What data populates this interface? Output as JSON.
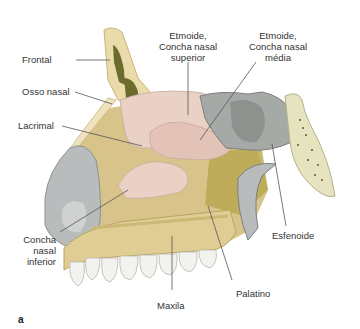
{
  "figure": {
    "panel_letter": "a",
    "labels": {
      "frontal": "Frontal",
      "osso_nasal": "Osso nasal",
      "lacrimal": "Lacrimal",
      "concha_inferior": [
        "Concha",
        "nasal",
        "inferior"
      ],
      "etmoide_superior": [
        "Etmoide,",
        "Concha nasal",
        "superior"
      ],
      "etmoide_media": [
        "Etmoide,",
        "Concha nasal",
        "média"
      ],
      "esfenoide": "Esfenoide",
      "palatino": "Palatino",
      "maxila": "Maxila"
    },
    "colors": {
      "bone": "#e9dcaa",
      "bone_dark": "#c9b478",
      "concha": "#ead1c6",
      "sinus": "#6d6a2e",
      "cartilage_gray": "#b9bcbc",
      "sphenoid_sinus": "#a5aaa7",
      "teeth": "#f2f2ee",
      "leader_line": "#555555"
    }
  }
}
